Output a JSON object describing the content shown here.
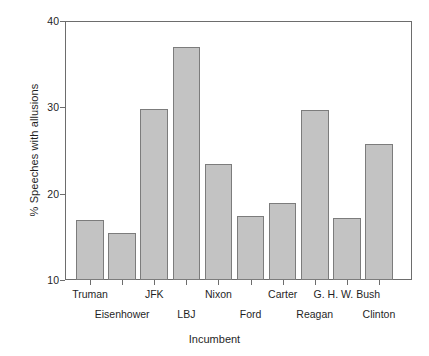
{
  "chart_data": {
    "type": "bar",
    "title": "",
    "xlabel": "Incumbent",
    "ylabel": "% Speeches with allusions",
    "categories": [
      "Truman",
      "Eisenhower",
      "JFK",
      "LBJ",
      "Nixon",
      "Ford",
      "Carter",
      "Reagan",
      "G. H. W. Bush",
      "Clinton"
    ],
    "values": [
      16.9,
      15.5,
      29.8,
      37.0,
      23.4,
      17.4,
      18.9,
      29.7,
      17.2,
      25.8
    ],
    "ylim": [
      10,
      40
    ],
    "yticks": [
      10,
      20,
      30,
      40
    ],
    "ytick_labels": [
      "10",
      "20",
      "30",
      "40"
    ],
    "grid": false,
    "legend": null,
    "bar_fill": "#c3c3c3",
    "bar_edge": "#7c7c7c",
    "axis_color": "#6d6d6d",
    "label_rows": [
      0,
      1,
      0,
      1,
      0,
      1,
      0,
      1,
      0,
      1
    ]
  }
}
